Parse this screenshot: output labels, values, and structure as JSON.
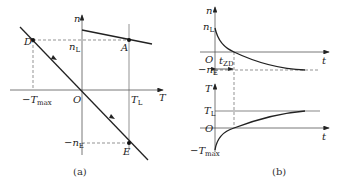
{
  "figure_a": {
    "caption": "(a)",
    "axes": {
      "x_label": "T",
      "y_label": "n",
      "origin_label": "O"
    },
    "labels": {
      "n_L": "n",
      "n_L_sub": "L",
      "T_L": "T",
      "T_L_sub": "L",
      "neg_T_max": "−T",
      "neg_T_max_sub": "max",
      "neg_n_E": "−n",
      "neg_n_E_sub": "E"
    },
    "points": {
      "D": "D",
      "A": "A",
      "E": "E"
    }
  },
  "figure_b": {
    "caption": "(b)",
    "top_plot": {
      "x_label": "t",
      "y_label": "n",
      "origin_label": "O",
      "n_L": "n",
      "n_L_sub": "L",
      "neg_n_E": "−n",
      "neg_n_E_sub": "E",
      "t_ZD": "t",
      "t_ZD_sub": "ZD"
    },
    "bottom_plot": {
      "x_label": "t",
      "y_label": "T",
      "origin_label": "O",
      "T_L": "T",
      "T_L_sub": "L",
      "neg_T_max": "−T",
      "neg_T_max_sub": "max"
    }
  },
  "colors": {
    "line": "#222222",
    "axis": "#555555",
    "dashed": "#666666"
  }
}
